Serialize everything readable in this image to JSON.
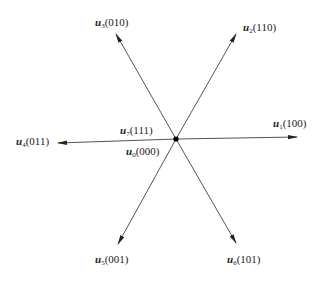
{
  "diagram": {
    "title": "",
    "center": {
      "x": 176,
      "y": 139
    },
    "origin_labels": [
      {
        "id": "u7",
        "symbol": "u",
        "index": "7",
        "state": "(111)",
        "x": 120,
        "y": 124
      },
      {
        "id": "u0",
        "symbol": "u",
        "index": "0",
        "state": "(000)",
        "x": 126,
        "y": 145
      }
    ],
    "vectors": [
      {
        "id": "u1",
        "symbol": "u",
        "index": "1",
        "state": "(100)",
        "tip": {
          "x": 297,
          "y": 137
        },
        "label_pos": {
          "x": 273,
          "y": 117
        }
      },
      {
        "id": "u2",
        "symbol": "u",
        "index": "2",
        "state": "(110)",
        "tip": {
          "x": 236,
          "y": 34
        },
        "label_pos": {
          "x": 243,
          "y": 21
        }
      },
      {
        "id": "u3",
        "symbol": "u",
        "index": "3",
        "state": "(010)",
        "tip": {
          "x": 116,
          "y": 34
        },
        "label_pos": {
          "x": 95,
          "y": 16
        }
      },
      {
        "id": "u4",
        "symbol": "u",
        "index": "4",
        "state": "(011)",
        "tip": {
          "x": 58,
          "y": 143
        },
        "label_pos": {
          "x": 16,
          "y": 135
        }
      },
      {
        "id": "u5",
        "symbol": "u",
        "index": "5",
        "state": "(001)",
        "tip": {
          "x": 118,
          "y": 244
        },
        "label_pos": {
          "x": 95,
          "y": 253
        }
      },
      {
        "id": "u6",
        "symbol": "u",
        "index": "6",
        "state": "(101)",
        "tip": {
          "x": 236,
          "y": 243
        },
        "label_pos": {
          "x": 227,
          "y": 253
        }
      }
    ],
    "line_color": "#555555",
    "arrow_color": "#222222"
  }
}
